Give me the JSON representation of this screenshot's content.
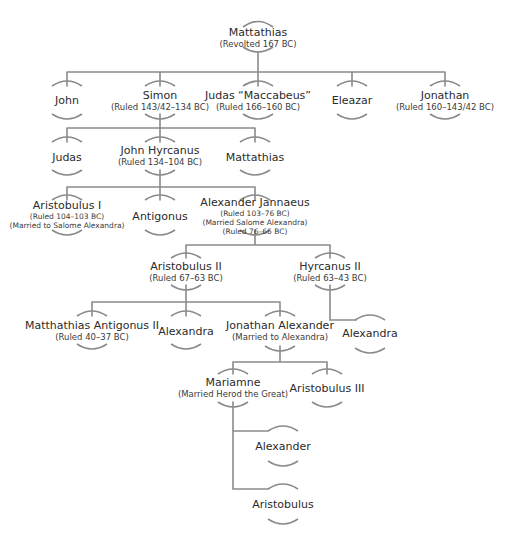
{
  "colors": {
    "line": "#8a8a8a",
    "text": "#2b2b2b",
    "background": "#ffffff"
  },
  "people": {
    "mattathias": {
      "name": "Mattathias",
      "notes": [
        "(Revolted 167 BC)"
      ]
    },
    "john": {
      "name": "John",
      "notes": []
    },
    "simon": {
      "name": "Simon",
      "notes": [
        "(Ruled 143/42–134 BC)"
      ]
    },
    "judas_maccabeus": {
      "name": "Judas “Maccabeus”",
      "notes": [
        "(Ruled 166–160 BC)"
      ]
    },
    "eleazar": {
      "name": "Eleazar",
      "notes": []
    },
    "jonathan": {
      "name": "Jonathan",
      "notes": [
        "(Ruled 160–143/42 BC)"
      ]
    },
    "judas": {
      "name": "Judas",
      "notes": []
    },
    "john_hyrcanus": {
      "name": "John Hyrcanus",
      "notes": [
        "(Ruled 134–104 BC)"
      ]
    },
    "mattathias_2": {
      "name": "Mattathias",
      "notes": []
    },
    "aristobulus_1": {
      "name": "Aristobulus I",
      "notes": [
        "(Ruled 104–103 BC)",
        "(Married to Salome Alexandra)"
      ]
    },
    "antigonus": {
      "name": "Antigonus",
      "notes": []
    },
    "alexander_jannaeus": {
      "name": "Alexander Jannaeus",
      "notes": [
        "(Ruled 103–76 BC)",
        "(Married Salome Alexandra)",
        "(Ruled 76–66 BC)"
      ]
    },
    "aristobulus_2": {
      "name": "Aristobulus II",
      "notes": [
        "(Ruled 67–63 BC)"
      ]
    },
    "hyrcanus_2": {
      "name": "Hyrcanus II",
      "notes": [
        "(Ruled 63–43 BC)"
      ]
    },
    "matthathias_antigonus_2": {
      "name": "Matthathias Antigonus II",
      "notes": [
        "(Ruled 40–37 BC)"
      ]
    },
    "alexandra_1": {
      "name": "Alexandra",
      "notes": []
    },
    "jonathan_alexander": {
      "name": "Jonathan Alexander",
      "notes": [
        "(Married to Alexandra)"
      ]
    },
    "alexandra_2": {
      "name": "Alexandra",
      "notes": []
    },
    "mariamne": {
      "name": "Mariamne",
      "notes": [
        "(Married Herod the Great)"
      ]
    },
    "aristobulus_3": {
      "name": "Aristobulus III",
      "notes": []
    },
    "alexander": {
      "name": "Alexander",
      "notes": []
    },
    "aristobulus": {
      "name": "Aristobulus",
      "notes": []
    }
  }
}
